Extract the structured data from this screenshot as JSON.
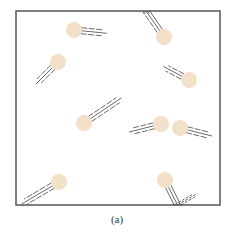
{
  "figure": {
    "caption": "(a)",
    "box": {
      "x": 16,
      "y": 11,
      "width": 204,
      "height": 194,
      "stroke": "#555555"
    },
    "ball_color": "#f3e0c8",
    "trail_color": "#444444",
    "ball_radius": 8,
    "balls": [
      {
        "id": 1,
        "cx": 74,
        "cy": 30,
        "trail_dx": 1,
        "trail_dy": 0.1,
        "length": 26
      },
      {
        "id": 2,
        "cx": 164,
        "cy": 37,
        "trail_dx": -0.55,
        "trail_dy": -0.8,
        "length": 30,
        "reflect": "top"
      },
      {
        "id": 3,
        "cx": 58,
        "cy": 62,
        "trail_dx": -0.7,
        "trail_dy": 0.7,
        "length": 24
      },
      {
        "id": 4,
        "cx": 189,
        "cy": 80,
        "trail_dx": -0.85,
        "trail_dy": -0.45,
        "length": 22
      },
      {
        "id": 5,
        "cx": 84,
        "cy": 123,
        "trail_dx": 0.82,
        "trail_dy": -0.55,
        "length": 38
      },
      {
        "id": 6,
        "cx": 161,
        "cy": 124,
        "trail_dx": -1,
        "trail_dy": 0.25,
        "length": 26
      },
      {
        "id": 7,
        "cx": 180,
        "cy": 128,
        "trail_dx": 1,
        "trail_dy": 0.25,
        "length": 26
      },
      {
        "id": 8,
        "cx": 59,
        "cy": 182,
        "trail_dx": -0.85,
        "trail_dy": 0.5,
        "length": 36
      },
      {
        "id": 9,
        "cx": 165,
        "cy": 180,
        "trail_dx": 0.45,
        "trail_dy": 0.9,
        "length": 28,
        "reflect": "bottom"
      }
    ]
  }
}
